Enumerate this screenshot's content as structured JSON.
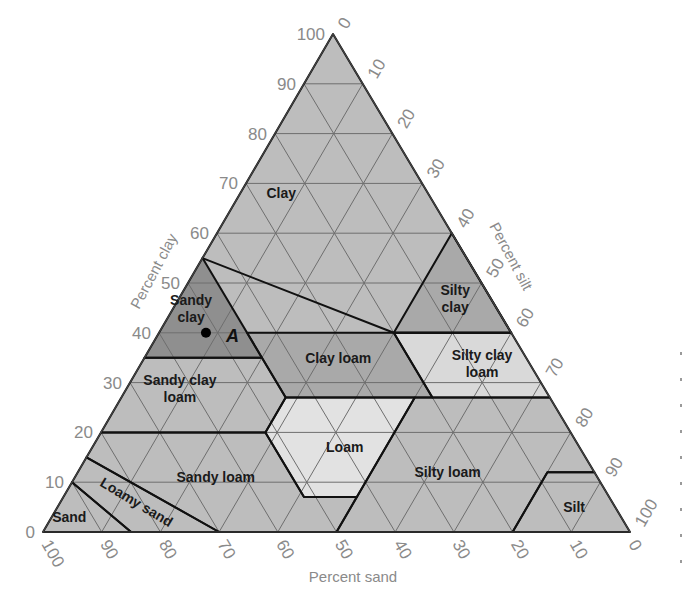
{
  "chart_data": {
    "type": "ternary",
    "title": "",
    "axes": {
      "clay": {
        "label": "Percent clay",
        "ticks": [
          0,
          10,
          20,
          30,
          40,
          50,
          60,
          70,
          80,
          90,
          100
        ]
      },
      "silt": {
        "label": "Percent silt",
        "ticks": [
          0,
          10,
          20,
          30,
          40,
          50,
          60,
          70,
          80,
          90,
          100
        ]
      },
      "sand": {
        "label": "Percent sand",
        "ticks": [
          100,
          90,
          80,
          70,
          60,
          50,
          40,
          30,
          20,
          10,
          0
        ]
      }
    },
    "grid": true,
    "grid_step": 10,
    "colors": {
      "base": "#bdbdbd",
      "dark": "#8f8f8f",
      "medium": "#a9a9a9",
      "light": "#d9d9d9",
      "lighter": "#e2e2e2"
    },
    "regions": [
      {
        "name": "Clay",
        "label": "Clay",
        "shade": "base",
        "polygon_sand_clay": [
          [
            45,
            55
          ],
          [
            20,
            40
          ],
          [
            0,
            40
          ],
          [
            0,
            60
          ],
          [
            0,
            100
          ],
          [
            45,
            55
          ]
        ],
        "label_pos": [
          25,
          68
        ]
      },
      {
        "name": "Sandy clay",
        "label": "Sandy\nclay",
        "shade": "dark",
        "polygon_sand_clay": [
          [
            45,
            55
          ],
          [
            65,
            35
          ],
          [
            45,
            35
          ],
          [
            45,
            55
          ]
        ],
        "label_pos": [
          52,
          45
        ]
      },
      {
        "name": "Silty clay",
        "label": "Silty\nclay",
        "shade": "medium",
        "polygon_sand_clay": [
          [
            20,
            40
          ],
          [
            0,
            60
          ],
          [
            0,
            40
          ],
          [
            20,
            40
          ]
        ],
        "label_pos": [
          6,
          47
        ]
      },
      {
        "name": "Clay loam",
        "label": "Clay loam",
        "shade": "medium",
        "polygon_sand_clay": [
          [
            45,
            40
          ],
          [
            45,
            27
          ],
          [
            20,
            27
          ],
          [
            20,
            40
          ],
          [
            45,
            40
          ]
        ],
        "label_pos": [
          32,
          35
        ]
      },
      {
        "name": "Silty clay loam",
        "label": "Silty clay\nloam",
        "shade": "light",
        "polygon_sand_clay": [
          [
            20,
            40
          ],
          [
            20,
            27
          ],
          [
            0,
            27
          ],
          [
            0,
            40
          ],
          [
            20,
            40
          ]
        ],
        "label_pos": [
          8,
          34
        ]
      },
      {
        "name": "Sandy clay loam",
        "label": "Sandy clay\nloam",
        "shade": "base",
        "polygon_sand_clay": [
          [
            80,
            20
          ],
          [
            65,
            35
          ],
          [
            45,
            35
          ],
          [
            45,
            27
          ],
          [
            52,
            20
          ],
          [
            80,
            20
          ]
        ],
        "label_pos": [
          62,
          29
        ]
      },
      {
        "name": "Loam",
        "label": "Loam",
        "shade": "lighter",
        "polygon_sand_clay": [
          [
            45,
            27
          ],
          [
            52,
            20
          ],
          [
            52,
            7
          ],
          [
            43,
            7
          ],
          [
            23,
            27
          ],
          [
            45,
            27
          ]
        ],
        "label_pos": [
          40,
          17
        ]
      },
      {
        "name": "Silty loam",
        "label": "Silty loam",
        "shade": "base",
        "polygon_sand_clay": [
          [
            50,
            0
          ],
          [
            23,
            27
          ],
          [
            0,
            27
          ],
          [
            0,
            12
          ],
          [
            8,
            12
          ],
          [
            20,
            0
          ],
          [
            50,
            0
          ]
        ],
        "label_pos": [
          25,
          12
        ]
      },
      {
        "name": "Silt",
        "label": "Silt",
        "shade": "base",
        "polygon_sand_clay": [
          [
            20,
            0
          ],
          [
            8,
            12
          ],
          [
            0,
            12
          ],
          [
            0,
            0
          ],
          [
            20,
            0
          ]
        ],
        "label_pos": [
          7,
          5
        ]
      },
      {
        "name": "Sandy loam",
        "label": "Sandy loam",
        "shade": "base",
        "polygon_sand_clay": [
          [
            85,
            15
          ],
          [
            80,
            20
          ],
          [
            52,
            20
          ],
          [
            52,
            7
          ],
          [
            43,
            7
          ],
          [
            50,
            0
          ],
          [
            70,
            0
          ],
          [
            85,
            15
          ]
        ],
        "label_pos": [
          65,
          11
        ]
      },
      {
        "name": "Loamy sand",
        "label": "Loamy sand",
        "shade": "base",
        "polygon_sand_clay": [
          [
            90,
            10
          ],
          [
            85,
            15
          ],
          [
            70,
            0
          ],
          [
            85,
            0
          ],
          [
            90,
            10
          ]
        ],
        "label_pos": [
          81,
          6
        ]
      },
      {
        "name": "Sand",
        "label": "Sand",
        "shade": "base",
        "polygon_sand_clay": [
          [
            90,
            10
          ],
          [
            100,
            0
          ],
          [
            85,
            0
          ],
          [
            90,
            10
          ]
        ],
        "label_pos": [
          94,
          3
        ]
      }
    ],
    "points": [
      {
        "label": "A",
        "sand": 52,
        "clay": 40,
        "silt": 8
      }
    ]
  },
  "margin_marks": [
    "·",
    "·",
    "·",
    "·",
    "·",
    "·",
    "·",
    "·",
    "·"
  ]
}
